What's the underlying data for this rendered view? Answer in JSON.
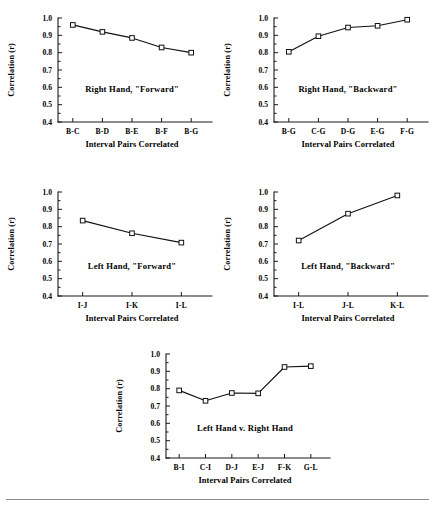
{
  "figure": {
    "background_color": "#ffffff",
    "line_color": "#111111",
    "marker_fill": "#ffffff",
    "axis_color": "#1a1a1a",
    "footer_rule_color": "#8c8c8c"
  },
  "common": {
    "ylabel": "Correlation (r)",
    "xlabel": "Interval Pairs Correlated",
    "ytick_labels": [
      "1.0",
      "0.9",
      "0.8",
      "0.7",
      "0.6",
      "0.5",
      "0.4"
    ],
    "ylim": [
      0.4,
      1.0
    ]
  },
  "chart_data": [
    {
      "id": "right-hand-forward",
      "type": "line",
      "title": "Right Hand, \"Forward\"",
      "annotation": "Right Hand, \"Forward\"",
      "xlabel": "Interval Pairs Correlated",
      "ylabel": "Correlation (r)",
      "categories": [
        "B-C",
        "B-D",
        "B-E",
        "B-F",
        "B-G"
      ],
      "values": [
        0.96,
        0.92,
        0.885,
        0.83,
        0.8
      ],
      "ylim": [
        0.4,
        1.0
      ],
      "yticks": [
        1.0,
        0.9,
        0.8,
        0.7,
        0.6,
        0.5,
        0.4
      ],
      "grid": false,
      "legend": "none",
      "marker": "open-square"
    },
    {
      "id": "right-hand-backward",
      "type": "line",
      "title": "Right Hand, \"Backward\"",
      "annotation": "Right Hand, \"Backward\"",
      "xlabel": "Interval Pairs Correlated",
      "ylabel": "Correlation (r)",
      "categories": [
        "B-G",
        "C-G",
        "D-G",
        "E-G",
        "F-G"
      ],
      "values": [
        0.805,
        0.895,
        0.945,
        0.955,
        0.99
      ],
      "ylim": [
        0.4,
        1.0
      ],
      "yticks": [
        1.0,
        0.9,
        0.8,
        0.7,
        0.6,
        0.5,
        0.4
      ],
      "grid": false,
      "legend": "none",
      "marker": "open-square"
    },
    {
      "id": "left-hand-forward",
      "type": "line",
      "title": "Left Hand, \"Forward\"",
      "annotation": "Left Hand, \"Forward\"",
      "xlabel": "Interval Pairs Correlated",
      "ylabel": "Correlation (r)",
      "categories": [
        "I-J",
        "I-K",
        "I-L"
      ],
      "values": [
        0.835,
        0.762,
        0.708
      ],
      "ylim": [
        0.4,
        1.0
      ],
      "yticks": [
        1.0,
        0.9,
        0.8,
        0.7,
        0.6,
        0.5,
        0.4
      ],
      "grid": false,
      "legend": "none",
      "marker": "open-square"
    },
    {
      "id": "left-hand-backward",
      "type": "line",
      "title": "Left Hand, \"Backward\"",
      "annotation": "Left Hand, \"Backward\"",
      "xlabel": "Interval Pairs Correlated",
      "ylabel": "Correlation (r)",
      "categories": [
        "I-L",
        "J-L",
        "K-L"
      ],
      "values": [
        0.72,
        0.875,
        0.98
      ],
      "ylim": [
        0.4,
        1.0
      ],
      "yticks": [
        1.0,
        0.9,
        0.8,
        0.7,
        0.6,
        0.5,
        0.4
      ],
      "grid": false,
      "legend": "none",
      "marker": "open-square"
    },
    {
      "id": "left-hand-v-right-hand",
      "type": "line",
      "title": "Left Hand v. Right Hand",
      "annotation": "Left Hand v. Right Hand",
      "xlabel": "Interval Pairs Correlated",
      "ylabel": "Correlation (r)",
      "categories": [
        "B-I",
        "C-I",
        "D-J",
        "E-J",
        "F-K",
        "G-L"
      ],
      "values": [
        0.79,
        0.73,
        0.775,
        0.773,
        0.925,
        0.93
      ],
      "ylim": [
        0.4,
        1.0
      ],
      "yticks": [
        1.0,
        0.9,
        0.8,
        0.7,
        0.6,
        0.5,
        0.4
      ],
      "grid": false,
      "legend": "none",
      "marker": "open-square"
    }
  ],
  "panels": [
    {
      "left": 0,
      "top": 4,
      "width": 218,
      "height": 164,
      "plot_w": 148,
      "plot_h": 104,
      "annot_y_frac": 0.42
    },
    {
      "left": 216,
      "top": 4,
      "width": 218,
      "height": 164,
      "plot_w": 148,
      "plot_h": 104,
      "annot_y_frac": 0.42
    },
    {
      "left": 0,
      "top": 178,
      "width": 218,
      "height": 164,
      "plot_w": 148,
      "plot_h": 104,
      "annot_y_frac": 0.45
    },
    {
      "left": 216,
      "top": 178,
      "width": 218,
      "height": 164,
      "plot_w": 148,
      "plot_h": 104,
      "annot_y_frac": 0.45
    },
    {
      "left": 108,
      "top": 340,
      "width": 228,
      "height": 164,
      "plot_w": 158,
      "plot_h": 104,
      "annot_y_frac": 0.45
    }
  ]
}
